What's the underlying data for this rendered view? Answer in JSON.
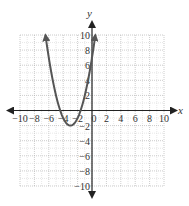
{
  "chart_data": {
    "type": "line",
    "title": "",
    "xlabel": "x",
    "ylabel": "y",
    "xlim": [
      -10,
      10
    ],
    "ylim": [
      -10,
      10
    ],
    "grid": true,
    "grid_step": 2,
    "x_ticks": [
      -10,
      -8,
      -6,
      -4,
      -2,
      0,
      2,
      4,
      6,
      8,
      10
    ],
    "y_ticks": [
      -10,
      -8,
      -6,
      -4,
      -2,
      2,
      4,
      6,
      8,
      10
    ],
    "x_tick_labels": [
      "−10",
      "−8",
      "−6",
      "−4",
      "−2",
      "0",
      "2",
      "4",
      "6",
      "8",
      "10"
    ],
    "y_tick_labels": [
      "−10",
      "−8",
      "−6",
      "−4",
      "−2",
      "2",
      "4",
      "6",
      "8",
      "10"
    ],
    "series": [
      {
        "name": "parabola",
        "equation": "y = (x + 3)^2 - 2",
        "vertex": [
          -3,
          -2
        ],
        "x_intercepts": [
          -4.41,
          -1.59
        ],
        "y_intercept": 7,
        "x": [
          -6.46,
          -6,
          -5,
          -4.41,
          -4,
          -3,
          -2,
          -1.59,
          -1,
          0,
          0.46
        ],
        "y": [
          10,
          7,
          2,
          0,
          -1,
          -2,
          -1,
          0,
          2,
          7,
          10
        ],
        "arrows_at_ends": true,
        "color": "#555555"
      }
    ]
  }
}
